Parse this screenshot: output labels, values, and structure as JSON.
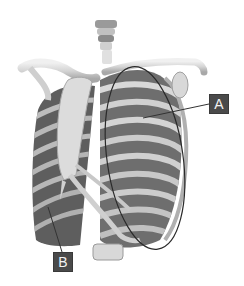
{
  "figure": {
    "colors": {
      "background": "#ffffff",
      "bone_light": "#e6e6e6",
      "bone_mid": "#c8c8c8",
      "bone_shadow": "#9a9a9a",
      "intercostal_dark": "#6e6e6e",
      "intercostal_darker": "#555555",
      "outline": "#2a2a2a",
      "label_bg": "#4a4a4a",
      "label_text": "#f2f2f2"
    }
  },
  "labels": [
    {
      "id": "A",
      "text": "A",
      "box": {
        "x": 209,
        "y": 94,
        "w": 20,
        "h": 20
      },
      "leader_to": {
        "x": 143,
        "y": 118
      }
    },
    {
      "id": "B",
      "text": "B",
      "box": {
        "x": 53,
        "y": 252,
        "w": 20,
        "h": 20
      },
      "leader_to": {
        "x": 48,
        "y": 207
      }
    }
  ]
}
